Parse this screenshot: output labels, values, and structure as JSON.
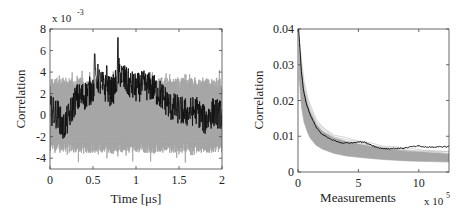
{
  "chart_data": [
    {
      "type": "line",
      "title": "",
      "xlabel": "Time [μs]",
      "ylabel": "Correlation",
      "y_exponent_label": "x 10",
      "y_exponent_power": "-3",
      "xlim": [
        0,
        2
      ],
      "ylim": [
        -5,
        8
      ],
      "xticks": [
        "0",
        "0.5",
        "1",
        "1.5",
        "2"
      ],
      "xtick_values": [
        0,
        0.5,
        1,
        1.5,
        2
      ],
      "yticks": [
        "-4",
        "-2",
        "0",
        "2",
        "4",
        "6",
        "8"
      ],
      "ytick_values": [
        -4,
        -2,
        0,
        2,
        4,
        6,
        8
      ],
      "grid": false,
      "legend": null,
      "series": [
        {
          "name": "wrong key hypotheses (noise band)",
          "color": "#a6a6a6",
          "kind": "band",
          "x": [
            0,
            2
          ],
          "upper": [
            3.5,
            3.5
          ],
          "lower": [
            -3.5,
            -3.5
          ],
          "peak_upper": 4.2,
          "peak_lower": -4.6
        },
        {
          "name": "correct key hypothesis",
          "color": "#111111",
          "kind": "noisy_line",
          "x": [
            0,
            0.1,
            0.15,
            0.2,
            0.3,
            0.4,
            0.5,
            0.55,
            0.6,
            0.7,
            0.75,
            0.8,
            0.9,
            1.0,
            1.1,
            1.2,
            1.3,
            1.4,
            1.5,
            1.6,
            1.7,
            1.8,
            1.9,
            2.0
          ],
          "y": [
            0.5,
            0.0,
            -1.2,
            -0.5,
            1.5,
            1.8,
            2.5,
            3.5,
            2.8,
            2.2,
            2.5,
            4.0,
            3.0,
            2.5,
            2.8,
            2.5,
            1.8,
            0.8,
            0.5,
            0.2,
            0.5,
            -0.5,
            0.3,
            0.0
          ],
          "amplitude": 1.4,
          "max": 7.2,
          "max_at": 0.79,
          "min": -2.3
        }
      ]
    },
    {
      "type": "line",
      "title": "",
      "xlabel": "Measurements",
      "ylabel": "Correlation",
      "x_exponent_label": "x 10",
      "x_exponent_power": "5",
      "xlim": [
        0,
        12.5
      ],
      "ylim": [
        0,
        0.04
      ],
      "xticks": [
        "0",
        "5",
        "10"
      ],
      "xtick_values": [
        0,
        5,
        10
      ],
      "yticks": [
        "0",
        "0.01",
        "0.02",
        "0.03",
        "0.04"
      ],
      "ytick_values": [
        0,
        0.01,
        0.02,
        0.03,
        0.04
      ],
      "grid": false,
      "legend": null,
      "series": [
        {
          "name": "wrong key hypotheses (max correlation band)",
          "color": "#a6a6a6",
          "kind": "band",
          "x": [
            0.1,
            0.3,
            0.5,
            0.8,
            1.0,
            1.5,
            2.0,
            3.0,
            4.0,
            5.0,
            6.0,
            7.0,
            8.0,
            9.0,
            10.0,
            11.0,
            12.5
          ],
          "upper": [
            0.034,
            0.028,
            0.023,
            0.019,
            0.017,
            0.0135,
            0.0115,
            0.0095,
            0.0085,
            0.0078,
            0.0072,
            0.0067,
            0.0063,
            0.006,
            0.0057,
            0.0054,
            0.0052
          ],
          "lower": [
            0.026,
            0.018,
            0.014,
            0.011,
            0.0095,
            0.0075,
            0.0064,
            0.0052,
            0.0045,
            0.0041,
            0.0038,
            0.0035,
            0.0033,
            0.0031,
            0.003,
            0.0029,
            0.0028
          ]
        },
        {
          "name": "correct key hypothesis",
          "color": "#111111",
          "kind": "line",
          "x": [
            0.05,
            0.15,
            0.3,
            0.5,
            0.7,
            1.0,
            1.3,
            1.6,
            2.0,
            2.5,
            3.0,
            3.5,
            4.0,
            4.5,
            5.0,
            5.5,
            6.0,
            6.5,
            7.0,
            7.5,
            8.0,
            8.5,
            9.0,
            9.5,
            10.0,
            10.5,
            11.0,
            11.5,
            12.0,
            12.5
          ],
          "y": [
            0.04,
            0.035,
            0.027,
            0.022,
            0.019,
            0.016,
            0.014,
            0.012,
            0.0105,
            0.0095,
            0.0088,
            0.0082,
            0.0081,
            0.0082,
            0.0085,
            0.0083,
            0.0077,
            0.0069,
            0.0066,
            0.0065,
            0.0066,
            0.0066,
            0.0068,
            0.0071,
            0.0072,
            0.007,
            0.0069,
            0.007,
            0.0071,
            0.0071
          ]
        }
      ]
    }
  ]
}
